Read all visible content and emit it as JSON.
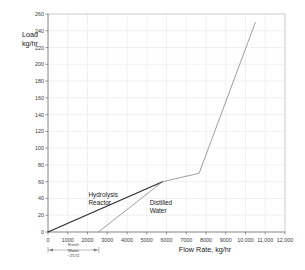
{
  "chart_data": {
    "type": "line",
    "title": "",
    "xlabel": "Flow Rate, kg/hr",
    "ylabel_line1": "Load",
    "ylabel_line2": "kg/hr",
    "xlim": [
      0,
      12000
    ],
    "ylim": [
      0,
      260
    ],
    "grid": true,
    "legend_position": "inline-annotations",
    "xticks": [
      0,
      1000,
      2000,
      3000,
      4000,
      5000,
      6000,
      7000,
      8000,
      9000,
      10000,
      11000,
      12000
    ],
    "xtick_labels": [
      "0",
      "1000",
      "2000",
      "3000",
      "4000",
      "5000",
      "6000",
      "7000",
      "8000",
      "9000",
      "10,000",
      "11,000",
      "12,000"
    ],
    "yticks": [
      0,
      20,
      40,
      60,
      80,
      100,
      120,
      140,
      160,
      180,
      200,
      220,
      240,
      260
    ],
    "ytick_labels": [
      "0",
      "20",
      "40",
      "60",
      "80",
      "100",
      "120",
      "140",
      "160",
      "180",
      "200",
      "220",
      "240",
      "260"
    ],
    "series": [
      {
        "name": "Hydrolysis Reactor",
        "color": "#2b2b2b",
        "label_x": 2050,
        "label_y": 42,
        "points": [
          [
            0,
            0
          ],
          [
            5800,
            60
          ]
        ]
      },
      {
        "name": "Distilled Water",
        "color": "#8c8c8c",
        "label_x": 5150,
        "label_y": 32,
        "points": [
          [
            2550,
            0
          ],
          [
            5800,
            60
          ],
          [
            7650,
            70
          ],
          [
            10500,
            250
          ]
        ]
      }
    ],
    "annotations": [
      {
        "name": "fresh-water-dimension",
        "line1": "Fresh",
        "line2": "Water",
        "line3": "~2572",
        "from_x": 0,
        "to_x": 2572
      }
    ]
  }
}
